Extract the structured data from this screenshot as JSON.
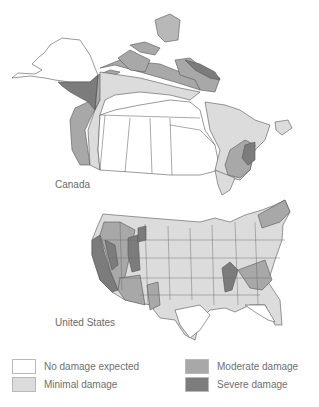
{
  "maps": {
    "canada": {
      "label": "Canada"
    },
    "united_states": {
      "label": "United States"
    }
  },
  "legend": {
    "items": [
      {
        "label": "No damage expected",
        "color": "#ffffff"
      },
      {
        "label": "Minimal damage",
        "color": "#dcdcdc"
      },
      {
        "label": "Moderate damage",
        "color": "#a8a8a8"
      },
      {
        "label": "Severe damage",
        "color": "#7c7c7c"
      }
    ]
  },
  "colors": {
    "none": "#ffffff",
    "minimal": "#dcdcdc",
    "moderate": "#a8a8a8",
    "severe": "#7c7c7c",
    "border": "#555555"
  }
}
